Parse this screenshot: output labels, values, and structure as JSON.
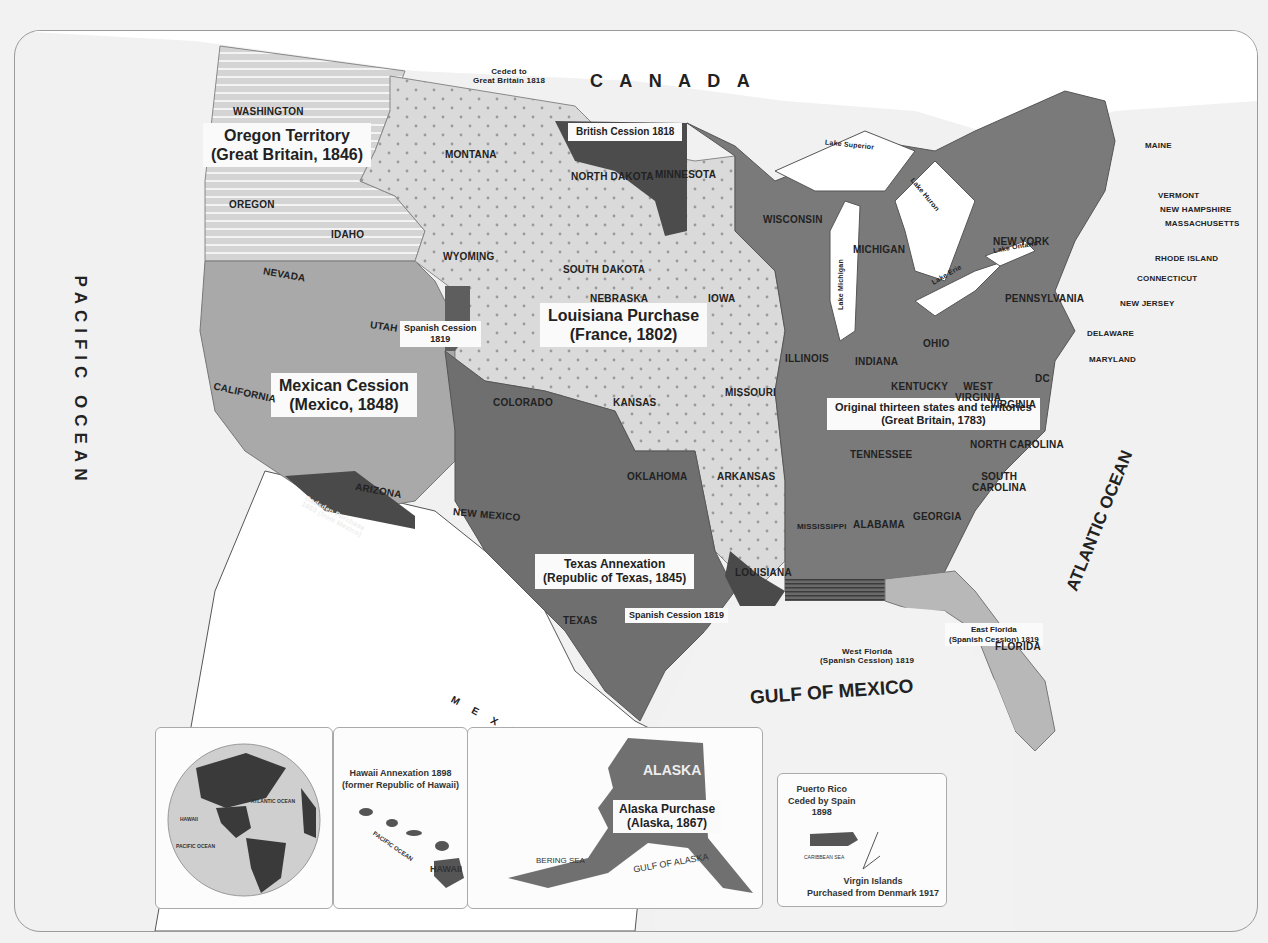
{
  "map": {
    "countries": {
      "canada": "C A N A D A",
      "mexico": "M E X I C O"
    },
    "oceans": {
      "pacific": "PACIFIC OCEAN",
      "atlantic": "ATLANTIC OCEAN",
      "gulf": "GULF OF MEXICO"
    },
    "regions": {
      "oregon": {
        "line1": "Oregon Territory",
        "line2": "(Great Britain, 1846)"
      },
      "louisiana": {
        "line1": "Louisiana Purchase",
        "line2": "(France, 1802)"
      },
      "mexican": {
        "line1": "Mexican Cession",
        "line2": "(Mexico, 1848)"
      },
      "original": {
        "line1": "Original thirteen states and territories",
        "line2": "(Great Britain, 1783)"
      },
      "texas": {
        "line1": "Texas Annexation",
        "line2": "(Republic of Texas, 1845)"
      },
      "british_cession": "British Cession 1818",
      "ceded_gb": {
        "line1": "Ceded to",
        "line2": "Great Britain 1818"
      },
      "spanish_1819_co": {
        "line1": "Spanish Cession",
        "line2": "1819"
      },
      "spanish_1819_la": "Spanish Cession 1819",
      "gadsden": {
        "line1": "Gadsden Purchase",
        "line2": "1853 (from Mexico)"
      },
      "west_florida": {
        "line1": "West Florida",
        "line2": "(Spanish Cession) 1819"
      },
      "east_florida": {
        "line1": "East Florida",
        "line2": "(Spanish Cession) 1819"
      }
    },
    "lakes": {
      "superior": "Lake Superior",
      "michigan": "Lake Michigan",
      "huron": "Lake Huron",
      "erie": "Lake Erie",
      "ontario": "Lake Ontario"
    },
    "states": {
      "washington": "WASHINGTON",
      "oregon": "OREGON",
      "idaho": "IDAHO",
      "montana": "MONTANA",
      "wyoming": "WYOMING",
      "nevada": "NEVADA",
      "utah": "UTAH",
      "california": "CALIFORNIA",
      "arizona": "ARIZONA",
      "new_mexico": "NEW MEXICO",
      "colorado": "COLORADO",
      "north_dakota": "NORTH DAKOTA",
      "south_dakota": "SOUTH DAKOTA",
      "nebraska": "NEBRASKA",
      "kansas": "KANSAS",
      "oklahoma": "OKLAHOMA",
      "texas": "TEXAS",
      "minnesota": "MINNESOTA",
      "iowa": "IOWA",
      "missouri": "MISSOURI",
      "arkansas": "ARKANSAS",
      "louisiana": "LOUISIANA",
      "wisconsin": "WISCONSIN",
      "michigan": "MICHIGAN",
      "illinois": "ILLINOIS",
      "indiana": "INDIANA",
      "ohio": "OHIO",
      "kentucky": "KENTUCKY",
      "tennessee": "TENNESSEE",
      "mississippi": "MISSISSIPPI",
      "alabama": "ALABAMA",
      "georgia": "GEORGIA",
      "florida": "FLORIDA",
      "south_carolina_1": "SOUTH",
      "south_carolina_2": "CAROLINA",
      "north_carolina": "NORTH CAROLINA",
      "virginia": "VIRGINIA",
      "west_virginia_1": "WEST",
      "west_virginia_2": "VIRGINIA",
      "dc": "DC",
      "pennsylvania": "PENNSYLVANIA",
      "new_york": "NEW YORK",
      "maine": "MAINE",
      "vermont": "VERMONT",
      "new_hampshire": "NEW HAMPSHIRE",
      "massachusetts": "MASSACHUSETTS",
      "rhode_island": "RHODE ISLAND",
      "connecticut": "CONNECTICUT",
      "new_jersey": "NEW JERSEY",
      "delaware": "DELAWARE",
      "maryland": "MARYLAND"
    },
    "colors": {
      "original": "#7b7b7b",
      "texas": "#6f6f6f",
      "mexican": "#a8a8a8",
      "louisiana": "#d9d9d9",
      "oregon": "#dcdcdc",
      "dark_cession": "#4a4a4a",
      "florida": "#b9b9b9",
      "water": "#f4f4f4",
      "foreign": "#ffffff"
    }
  },
  "insets": {
    "globe": {
      "atlantic": "ATLANTIC OCEAN",
      "pacific": "PACIFIC OCEAN",
      "hawaii": "HAWAII"
    },
    "hawaii": {
      "line1": "Hawaii Annexation 1898",
      "line2": "(former Republic of Hawaii)",
      "ocean": "PACIFIC OCEAN",
      "label": "HAWAII"
    },
    "alaska": {
      "label": "ALASKA",
      "line1": "Alaska Purchase",
      "line2": "(Alaska, 1867)",
      "bering": "BERING SEA",
      "gulf": "GULF OF ALASKA"
    },
    "puerto_rico": {
      "line1": "Puerto Rico",
      "line2": "Ceded by Spain",
      "line3": "1898",
      "sea": "CARIBBEAN SEA",
      "vi1": "Virgin Islands",
      "vi2": "Purchased from Denmark 1917"
    }
  }
}
